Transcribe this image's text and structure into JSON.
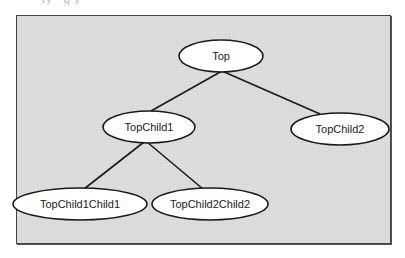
{
  "caption": {
    "visible_fragment": "ty          ·               g               y"
  },
  "diagram": {
    "type": "tree",
    "background": "#dcdcdc",
    "border_color": "#444444",
    "nodes": [
      {
        "id": "top",
        "label": "Top",
        "cx": 221,
        "cy": 56,
        "rx": 42,
        "ry": 16
      },
      {
        "id": "topchild1",
        "label": "TopChild1",
        "cx": 149,
        "cy": 127,
        "rx": 46,
        "ry": 16
      },
      {
        "id": "topchild2",
        "label": "TopChild2",
        "cx": 340,
        "cy": 129,
        "rx": 49,
        "ry": 16
      },
      {
        "id": "topchild1child1",
        "label": "TopChild1Child1",
        "cx": 80,
        "cy": 204,
        "rx": 67,
        "ry": 16
      },
      {
        "id": "topchild2child2",
        "label": "TopChild2Child2",
        "cx": 210,
        "cy": 204,
        "rx": 58,
        "ry": 16
      }
    ],
    "edges": [
      {
        "from": "Top",
        "to": "TopChild1"
      },
      {
        "from": "Top",
        "to": "TopChild2"
      },
      {
        "from": "TopChild1",
        "to": "TopChild1Child1"
      },
      {
        "from": "TopChild1",
        "to": "TopChild2Child2"
      }
    ]
  }
}
